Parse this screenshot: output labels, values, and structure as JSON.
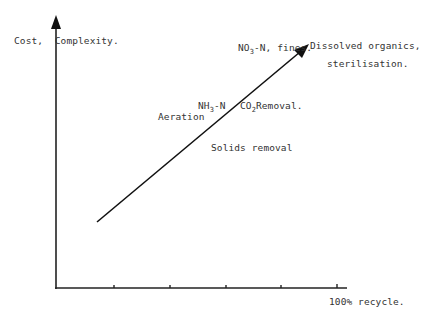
{
  "diagram": {
    "y_axis_label": "Cost,  Complexity.",
    "x_axis_end_label": "100% recycle.",
    "x_ticks": 5,
    "arrow": {
      "from": [
        97,
        222
      ],
      "to": [
        309,
        44
      ]
    },
    "labels": {
      "aeration": "Aeration",
      "nh3_main": "NH",
      "nh3_sub": "3",
      "nh3_rest": "-N",
      "co2_main": "CO",
      "co2_sub": "2",
      "co2_rest": "Removal.",
      "no3_main": "NO",
      "no3_sub": "3",
      "no3_rest": "-N, fines.",
      "dissolved_line1": "Dissolved organics,",
      "dissolved_line2": "sterilisation.",
      "solids": "Solids removal"
    },
    "colors": {
      "ink": "#222222",
      "text": "#333333"
    }
  }
}
